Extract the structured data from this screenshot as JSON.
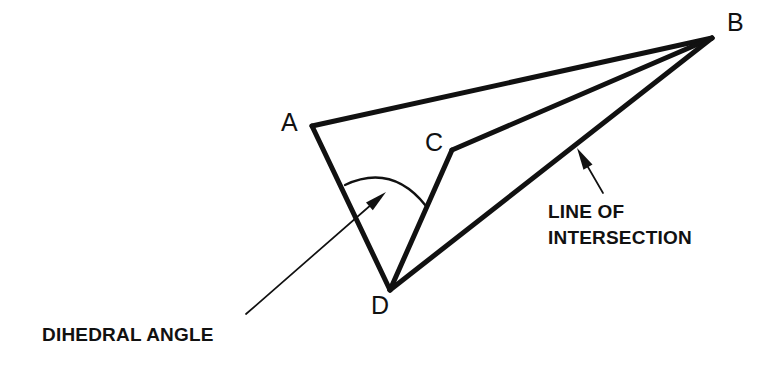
{
  "figure": {
    "background_color": "#ffffff",
    "stroke_color": "#111111",
    "width": 767,
    "height": 376
  },
  "vertices": [
    {
      "id": "A",
      "label": "A",
      "x": 312,
      "y": 126,
      "label_x": 281,
      "label_y": 110
    },
    {
      "id": "B",
      "label": "B",
      "x": 712,
      "y": 38,
      "label_x": 727,
      "label_y": 10
    },
    {
      "id": "C",
      "label": "C",
      "x": 452,
      "y": 150,
      "label_x": 425,
      "label_y": 130
    },
    {
      "id": "D",
      "label": "D",
      "x": 390,
      "y": 290,
      "label_x": 371,
      "label_y": 293
    }
  ],
  "edges": [
    {
      "name": "edge-a-b",
      "from": "A",
      "to": "B"
    },
    {
      "name": "edge-a-d",
      "from": "A",
      "to": "D"
    },
    {
      "name": "edge-c-b",
      "from": "C",
      "to": "B"
    },
    {
      "name": "edge-c-d",
      "from": "C",
      "to": "D"
    },
    {
      "name": "edge-d-b",
      "from": "D",
      "to": "B",
      "role": "line of intersection"
    }
  ],
  "angle_marker": {
    "name": "dihedral-angle-arc",
    "vertex": "D",
    "arc_path": "M 345 185 Q 392 163 426 206",
    "arrow_tip_x": 386,
    "arrow_tip_y": 192
  },
  "callouts": [
    {
      "id": "dihedral-angle",
      "text": "DIHEDRAL ANGLE",
      "label_x": 42,
      "label_y": 322,
      "leader_path": "M 246 314 L 380 197",
      "arrow_tip_x": 386,
      "arrow_tip_y": 192,
      "arrow_angle_deg": -41
    },
    {
      "id": "line-of-intersection",
      "text": "LINE OF\nINTERSECTION",
      "label_x": 548,
      "label_y": 199,
      "leader_path": "M 603 193 L 581 155",
      "arrow_tip_x": 577,
      "arrow_tip_y": 148,
      "arrow_angle_deg": -120
    }
  ]
}
